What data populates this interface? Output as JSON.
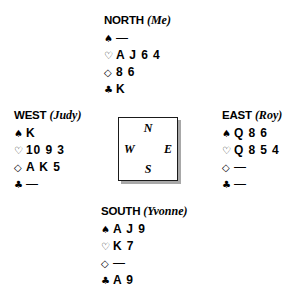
{
  "diagram": {
    "type": "bridge-hand-diagram",
    "suit_symbols": {
      "spade": "♠",
      "heart": "♡",
      "diamond": "◇",
      "club": "♣"
    },
    "void_mark": "—"
  },
  "compass": {
    "north": "N",
    "west": "W",
    "east": "E",
    "south": "S"
  },
  "hands": {
    "north": {
      "seat": "NORTH",
      "player": "(Me)",
      "suits": [
        {
          "symbol": "♠",
          "name": "spades",
          "cards": "—"
        },
        {
          "symbol": "♡",
          "name": "hearts",
          "cards": "A J 6 4"
        },
        {
          "symbol": "◇",
          "name": "diamonds",
          "cards": "8 6"
        },
        {
          "symbol": "♣",
          "name": "clubs",
          "cards": "K"
        }
      ]
    },
    "west": {
      "seat": "WEST",
      "player": "(Judy)",
      "suits": [
        {
          "symbol": "♠",
          "name": "spades",
          "cards": "K"
        },
        {
          "symbol": "♡",
          "name": "hearts",
          "cards": "10 9 3"
        },
        {
          "symbol": "◇",
          "name": "diamonds",
          "cards": "A K 5"
        },
        {
          "symbol": "♣",
          "name": "clubs",
          "cards": "—"
        }
      ]
    },
    "east": {
      "seat": "EAST",
      "player": "(Roy)",
      "suits": [
        {
          "symbol": "♠",
          "name": "spades",
          "cards": "Q 8 6"
        },
        {
          "symbol": "♡",
          "name": "hearts",
          "cards": "Q 8 5 4"
        },
        {
          "symbol": "◇",
          "name": "diamonds",
          "cards": "—"
        },
        {
          "symbol": "♣",
          "name": "clubs",
          "cards": "—"
        }
      ]
    },
    "south": {
      "seat": "SOUTH",
      "player": "(Yvonne)",
      "suits": [
        {
          "symbol": "♠",
          "name": "spades",
          "cards": "A J 9"
        },
        {
          "symbol": "♡",
          "name": "hearts",
          "cards": "K 7"
        },
        {
          "symbol": "◇",
          "name": "diamonds",
          "cards": "—"
        },
        {
          "symbol": "♣",
          "name": "clubs",
          "cards": "A 9"
        }
      ]
    }
  }
}
